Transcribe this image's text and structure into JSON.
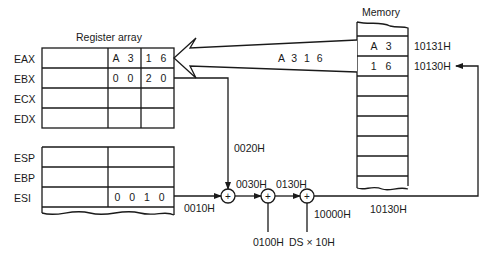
{
  "register_array": {
    "title": "Register array",
    "general_registers": [
      {
        "name": "EAX",
        "high_byte": "A 3",
        "low_byte": "1 6"
      },
      {
        "name": "EBX",
        "high_byte": "0 0",
        "low_byte": "2 0"
      },
      {
        "name": "ECX",
        "high_byte": "",
        "low_byte": ""
      },
      {
        "name": "EDX",
        "high_byte": "",
        "low_byte": ""
      }
    ],
    "pointer_registers": [
      {
        "name": "ESP",
        "value": ""
      },
      {
        "name": "EBP",
        "value": ""
      },
      {
        "name": "ESI",
        "value": "0 0 1 0"
      }
    ]
  },
  "memory": {
    "title": "Memory",
    "cells": [
      {
        "value": "A 3",
        "address": "10131H"
      },
      {
        "value": "1 6",
        "address": "10130H"
      }
    ]
  },
  "transfer_label": "A 3 1 6",
  "address_calc": {
    "ebx_value": "0020H",
    "esi_value": "0010H",
    "sum1": "0030H",
    "displacement": "0100H",
    "sum2": "0130H",
    "segment_base": "10000H",
    "segment_expr": "DS × 10H",
    "physical_address": "10130H",
    "adder_symbol": "+"
  }
}
